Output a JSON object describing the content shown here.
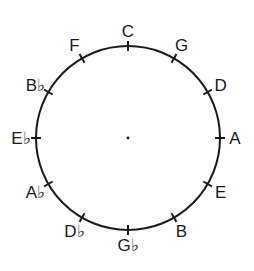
{
  "diagram": {
    "center": {
      "x": 128,
      "y": 138
    },
    "radius": 92,
    "stroke_color": "#1a1a1a",
    "label_color": "#1a1a1a",
    "notes": [
      {
        "label": "C",
        "angle": 0
      },
      {
        "label": "G",
        "angle": 30
      },
      {
        "label": "D",
        "angle": 60
      },
      {
        "label": "A",
        "angle": 90
      },
      {
        "label": "E",
        "angle": 120
      },
      {
        "label": "B",
        "angle": 150
      },
      {
        "label": "G♭",
        "angle": 180
      },
      {
        "label": "D♭",
        "angle": 210
      },
      {
        "label": "A♭",
        "angle": 240
      },
      {
        "label": "E♭",
        "angle": 270
      },
      {
        "label": "B♭",
        "angle": 300
      },
      {
        "label": "F",
        "angle": 330
      }
    ]
  }
}
